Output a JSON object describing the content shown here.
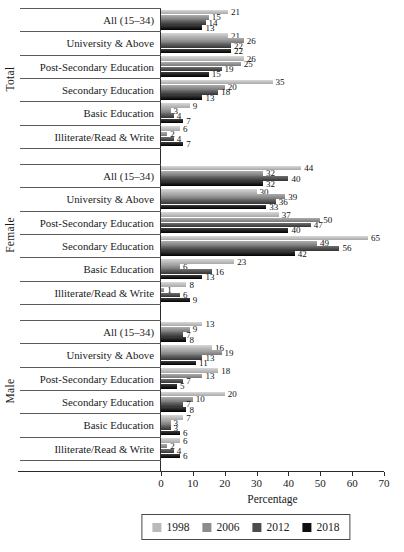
{
  "figure_name": "bar-chart-unemployment-by-education",
  "chart_data": {
    "type": "bar",
    "orientation": "horizontal",
    "title": "",
    "xlabel": "Percentage",
    "xlim": [
      0,
      70
    ],
    "xticks": [
      "0",
      "10",
      "20",
      "30",
      "40",
      "50",
      "60",
      "70"
    ],
    "legend_position": "bottom",
    "series_order": [
      "1998",
      "2006",
      "2012",
      "2018"
    ],
    "series_colors": [
      "#b9b9b9",
      "#8c8c8c",
      "#4c4c4c",
      "#0f0f0f"
    ],
    "series_fills": [
      [
        "#d8d8d8",
        "#a8a8a8"
      ],
      [
        "#adadad",
        "#787878"
      ],
      [
        "#707070",
        "#333333"
      ],
      [
        "#3e3e3e",
        "#000000"
      ]
    ],
    "axis_color": "#2b2b2b",
    "groups": [
      {
        "label": "Total",
        "rows": [
          {
            "category": "All (15–34)",
            "values": [
              21,
              15,
              14,
              13
            ]
          },
          {
            "category": "University & Above",
            "values": [
              21,
              26,
              22,
              22
            ]
          },
          {
            "category": "Post-Secondary Education",
            "values": [
              26,
              25,
              19,
              15
            ]
          },
          {
            "category": "Secondary Education",
            "values": [
              35,
              20,
              18,
              13
            ]
          },
          {
            "category": "Basic Education",
            "values": [
              9,
              3,
              4,
              7
            ]
          },
          {
            "category": "Illiterate/Read & Write",
            "values": [
              6,
              2,
              4,
              7
            ]
          }
        ]
      },
      {
        "label": "Female",
        "rows": [
          {
            "category": "All (15–34)",
            "values": [
              44,
              32,
              40,
              32
            ]
          },
          {
            "category": "University & Above",
            "values": [
              30,
              39,
              36,
              33
            ]
          },
          {
            "category": "Post-Secondary Education",
            "values": [
              37,
              50,
              47,
              40
            ]
          },
          {
            "category": "Secondary Education",
            "values": [
              65,
              49,
              56,
              42
            ]
          },
          {
            "category": "Basic Education",
            "values": [
              23,
              6,
              16,
              13
            ]
          },
          {
            "category": "Illiterate/Read & Write",
            "values": [
              8,
              1,
              6,
              9
            ]
          }
        ]
      },
      {
        "label": "Male",
        "rows": [
          {
            "category": "All (15–34)",
            "values": [
              13,
              9,
              7,
              8
            ]
          },
          {
            "category": "University & Above",
            "values": [
              16,
              19,
              13,
              11
            ]
          },
          {
            "category": "Post-Secondary Education",
            "values": [
              18,
              13,
              7,
              5
            ]
          },
          {
            "category": "Secondary Education",
            "values": [
              20,
              10,
              7,
              8
            ]
          },
          {
            "category": "Basic Education",
            "values": [
              7,
              3,
              3,
              6
            ]
          },
          {
            "category": "Illiterate/Read & Write",
            "values": [
              6,
              2,
              4,
              6
            ]
          }
        ]
      }
    ]
  }
}
